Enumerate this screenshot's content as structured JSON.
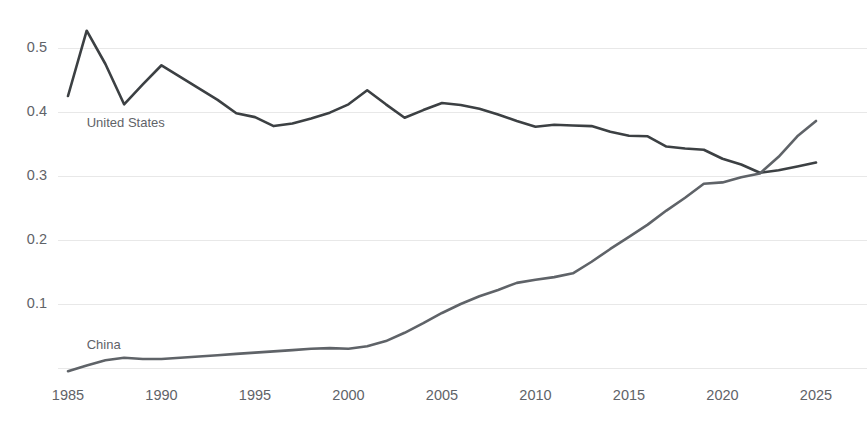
{
  "chart_data": {
    "type": "line",
    "title": "",
    "subtitle": "",
    "xlabel": "",
    "ylabel": "",
    "xlim": [
      1985,
      2025
    ],
    "ylim": [
      0,
      0.56
    ],
    "grid": true,
    "legend_position": "inline-labels",
    "x_ticks": [
      1985,
      1990,
      1995,
      2000,
      2005,
      2010,
      2015,
      2020,
      2025
    ],
    "x_tick_labels": [
      "1985",
      "1990",
      "1995",
      "2000",
      "2005",
      "2010",
      "2015",
      "2020",
      "2025"
    ],
    "y_ticks": [
      0.1,
      0.2,
      0.3,
      0.4,
      0.5
    ],
    "y_tick_labels": [
      "0.1",
      "0.2",
      "0.3",
      "0.4",
      "0.5"
    ],
    "x": [
      1985,
      1986,
      1987,
      1988,
      1989,
      1990,
      1991,
      1992,
      1993,
      1994,
      1995,
      1996,
      1997,
      1998,
      1999,
      2000,
      2001,
      2002,
      2003,
      2004,
      2005,
      2006,
      2007,
      2008,
      2009,
      2010,
      2011,
      2012,
      2013,
      2014,
      2015,
      2016,
      2017,
      2018,
      2019,
      2020,
      2021,
      2022,
      2023,
      2024,
      2025
    ],
    "series": [
      {
        "name": "United States",
        "color": "#3c4043",
        "label_x": 1986,
        "label_y": 0.382,
        "values": [
          0.425,
          0.527,
          0.475,
          0.412,
          0.443,
          0.473,
          0.455,
          0.437,
          0.419,
          0.398,
          0.392,
          0.378,
          0.382,
          0.39,
          0.399,
          0.412,
          0.434,
          0.412,
          0.391,
          0.403,
          0.414,
          0.411,
          0.405,
          0.396,
          0.386,
          0.377,
          0.38,
          0.379,
          0.378,
          0.369,
          0.363,
          0.362,
          0.346,
          0.343,
          0.341,
          0.327,
          0.318,
          0.305,
          0.309,
          0.315,
          0.321
        ]
      },
      {
        "name": "China",
        "color": "#5f6368",
        "label_x": 1986,
        "label_y": 0.035,
        "values": [
          -0.005,
          0.004,
          0.012,
          0.016,
          0.014,
          0.014,
          0.016,
          0.018,
          0.02,
          0.022,
          0.024,
          0.026,
          0.028,
          0.03,
          0.031,
          0.03,
          0.034,
          0.042,
          0.055,
          0.07,
          0.086,
          0.1,
          0.112,
          0.122,
          0.133,
          0.138,
          0.142,
          0.148,
          0.166,
          0.186,
          0.205,
          0.224,
          0.246,
          0.266,
          0.288,
          0.29,
          0.298,
          0.304,
          0.33,
          0.362,
          0.386
        ]
      }
    ]
  },
  "axes_geometry": {
    "plot_left": 68,
    "plot_right": 816,
    "y_zero_px": 368,
    "px_per_unit": 640,
    "x_tick_label_y": 390,
    "ytick_label_x": 47
  }
}
